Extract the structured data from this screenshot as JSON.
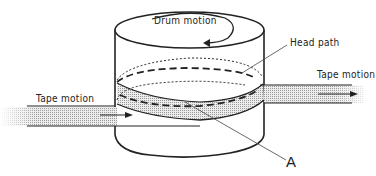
{
  "diagram": {
    "type": "helical-scan drum with tape wrap",
    "labels": {
      "drum_motion": "Drum motion",
      "head_path": "Head path",
      "tape_motion_left": "Tape motion",
      "tape_motion_right": "Tape motion",
      "point_a": "A"
    },
    "colors": {
      "line": "#222222",
      "tape_fill": "#d8d8d8",
      "background": "#ffffff"
    }
  }
}
